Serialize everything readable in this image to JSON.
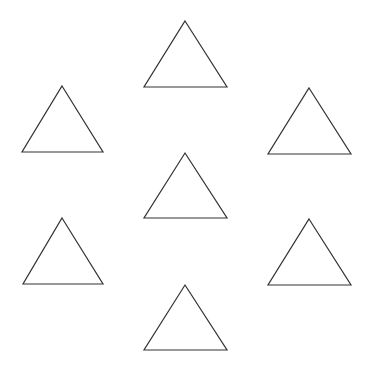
{
  "canvas": {
    "width": 373,
    "height": 372,
    "background": "#ffffff"
  },
  "style": {
    "stroke": "#333333",
    "stroke_width": 1.2,
    "fill": "none"
  },
  "shapes": [
    {
      "name": "triangle-top",
      "type": "triangle",
      "apex": [
        185,
        21
      ],
      "base_left": [
        144,
        87
      ],
      "base_right": [
        227,
        87
      ]
    },
    {
      "name": "triangle-upper-left",
      "type": "triangle",
      "apex": [
        62,
        86
      ],
      "base_left": [
        22,
        152
      ],
      "base_right": [
        103,
        152
      ]
    },
    {
      "name": "triangle-upper-right",
      "type": "triangle",
      "apex": [
        309,
        88
      ],
      "base_left": [
        268,
        154
      ],
      "base_right": [
        351,
        154
      ]
    },
    {
      "name": "triangle-center",
      "type": "triangle",
      "apex": [
        185,
        153
      ],
      "base_left": [
        144,
        218
      ],
      "base_right": [
        227,
        218
      ]
    },
    {
      "name": "triangle-lower-left",
      "type": "triangle",
      "apex": [
        62,
        218
      ],
      "base_left": [
        23,
        284
      ],
      "base_right": [
        103,
        284
      ]
    },
    {
      "name": "triangle-lower-right",
      "type": "triangle",
      "apex": [
        309,
        219
      ],
      "base_left": [
        268,
        285
      ],
      "base_right": [
        351,
        285
      ]
    },
    {
      "name": "triangle-bottom",
      "type": "triangle",
      "apex": [
        185,
        285
      ],
      "base_left": [
        144,
        350
      ],
      "base_right": [
        227,
        350
      ]
    }
  ]
}
